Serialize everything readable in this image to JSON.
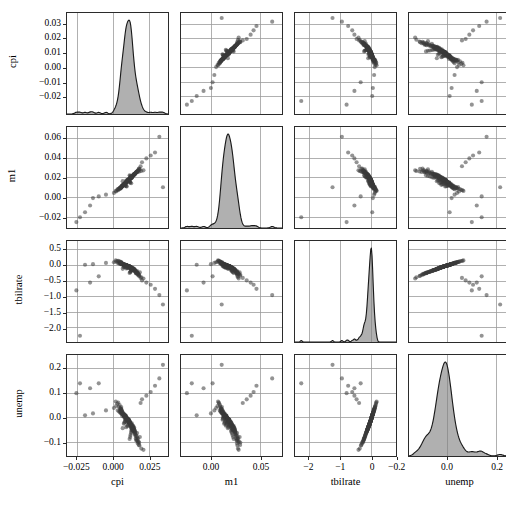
{
  "chart_data": {
    "type": "scatter",
    "plot_kind": "scatter-plot-matrix",
    "title": "",
    "variables": [
      "cpi",
      "m1",
      "tbilrate",
      "unemp"
    ],
    "grid": true,
    "legend": null,
    "diagonal": "kde",
    "axes": {
      "cpi": {
        "label": "cpi",
        "lim": [
          -0.032,
          0.038
        ],
        "xticks": [
          -0.025,
          0.0,
          0.025
        ],
        "xticklabels": [
          "−0.025",
          "0.000",
          "0.025"
        ],
        "yticks": [
          -0.02,
          -0.01,
          0.0,
          0.01,
          0.02,
          0.03
        ],
        "yticklabels": [
          "−0.02",
          "−0.01",
          "0.00",
          "0.01",
          "0.02",
          "0.03"
        ]
      },
      "m1": {
        "label": "m1",
        "lim": [
          -0.031,
          0.072
        ],
        "xticks": [
          0.0,
          0.05
        ],
        "xticklabels": [
          "0.00",
          "0.05"
        ],
        "yticks": [
          -0.02,
          0.0,
          0.02,
          0.04,
          0.06
        ],
        "yticklabels": [
          "−0.02",
          "0.00",
          "0.02",
          "0.04",
          "0.06"
        ]
      },
      "tbilrate": {
        "label": "tbilrate",
        "lim": [
          -2.45,
          0.78
        ],
        "xticks": [
          -2,
          -1,
          0
        ],
        "xticklabels": [
          "−2",
          "−1",
          "0"
        ],
        "yticks": [
          -2.0,
          -1.5,
          -1.0,
          -0.5,
          0.0,
          0.5
        ],
        "yticklabels": [
          "−2.0",
          "−1.5",
          "−1.0",
          "−0.5",
          "0.0",
          "0.5"
        ]
      },
      "unemp": {
        "label": "unemp",
        "lim": [
          -0.155,
          0.255
        ],
        "xticks": [
          -0.2,
          0.0,
          0.2
        ],
        "xticklabels": [
          "−0.2",
          "0.0",
          "0.2"
        ],
        "yticks": [
          -0.1,
          0.0,
          0.1,
          0.2
        ],
        "yticklabels": [
          "−0.1",
          "0.0",
          "0.1",
          "0.2"
        ]
      }
    },
    "marker": {
      "shape": "circle",
      "color": "#3a3a3a",
      "alpha": 0.55,
      "size": 2.1
    },
    "kde": {
      "fill_color": "#808080",
      "line_color": "#1a1a1a",
      "peaks": {
        "cpi": 0.0105,
        "m1": 0.0175,
        "tbilrate": -0.03,
        "unemp": -0.012
      },
      "notes": {
        "cpi": "sharp unimodal peak near 0.010 with small left shoulder near −0.015",
        "m1": "broad unimodal peak near 0.018",
        "tbilrate": "very sharp spike near 0.0 with long left tail to −2.3",
        "unemp": "sharp peak near −0.01 with right shoulder near 0.13"
      }
    },
    "series": {
      "cpi": [
        0.0105,
        0.0081,
        0.0129,
        0.0062,
        0.0142,
        0.0093,
        0.0047,
        0.0166,
        0.011,
        0.0074,
        0.0121,
        0.0058,
        0.0185,
        0.0099,
        0.0135,
        0.0032,
        0.0088,
        0.0154,
        0.0117,
        0.0069,
        0.0103,
        0.0146,
        0.0041,
        0.0091,
        0.0128,
        0.0077,
        0.0159,
        0.0112,
        0.0054,
        0.0133,
        0.0097,
        0.0171,
        0.0085,
        0.0118,
        0.0063,
        0.0141,
        0.0106,
        0.0049,
        0.0124,
        0.0089,
        0.0152,
        0.0115,
        0.0071,
        0.0137,
        0.0095,
        0.018,
        0.0108,
        0.0059,
        0.0126,
        0.0083,
        0.0148,
        0.0101,
        0.0066,
        0.0131,
        0.0092,
        0.0163,
        0.0113,
        0.0052,
        0.0122,
        0.0086,
        0.0144,
        0.0104,
        0.0073,
        0.0136,
        0.0096,
        0.0175,
        0.0109,
        0.0057,
        0.0125,
        0.0084,
        0.015,
        0.0102,
        0.0068,
        0.0132,
        0.0094,
        0.0168,
        0.0114,
        0.0051,
        0.012,
        0.0087,
        0.0143,
        0.01,
        0.0072,
        0.0138,
        0.0098,
        0.0178,
        0.0107,
        0.006,
        0.0127,
        0.0082,
        0.0147,
        0.0103,
        0.0067,
        0.013,
        0.009,
        0.0161,
        0.0111,
        0.0053,
        0.0123,
        0.0085,
        0.0145,
        0.0105,
        0.0075,
        0.0134,
        0.0093,
        0.0172,
        0.0116,
        0.0056,
        0.0119,
        0.0088,
        0.014,
        0.0099,
        0.007,
        0.0139,
        0.0091,
        0.0165,
        0.0106,
        0.0055,
        0.0129,
        0.008,
        0.0149,
        0.0104,
        0.0064,
        0.0135,
        0.0097,
        0.019,
        0.0122,
        0.0045,
        0.0116,
        0.0079,
        0.0151,
        0.0107,
        0.0061,
        0.0133,
        0.0095,
        0.02,
        0.0118,
        0.0035,
        0.0113,
        0.0076,
        0.0155,
        0.0109,
        0.0065,
        0.0131,
        0.0092,
        0.023,
        0.0127,
        0.002,
        0.011,
        0.0078,
        0.0157,
        0.011,
        0.0062,
        0.0128,
        0.0089,
        0.026,
        0.0121,
        0.0005,
        0.0108,
        0.0081,
        0.016,
        0.0112,
        0.0058,
        0.0126,
        0.0087,
        0.029,
        0.0124,
        -0.005,
        0.0102,
        0.0083,
        0.017,
        0.0115,
        0.0048,
        0.0124,
        0.0084,
        0.032,
        -0.01,
        -0.014,
        0.0098,
        0.0086,
        0.0182,
        0.0117,
        0.0038,
        0.012,
        0.008,
        0.0345,
        -0.016,
        -0.0195,
        0.009,
        0.009,
        0.0195,
        0.0119,
        0.0028,
        0.0118,
        0.0077,
        -0.023,
        -0.0255,
        0.0066,
        0.0094,
        0.021,
        0.0125,
        0.0018,
        0.0114,
        0.0074
      ],
      "m1": [
        0.0175,
        0.0142,
        0.0208,
        0.0121,
        0.0235,
        0.0163,
        0.0099,
        0.0262,
        0.0184,
        0.0136,
        0.0199,
        0.0113,
        0.0288,
        0.0171,
        0.0221,
        0.0086,
        0.0152,
        0.0248,
        0.0192,
        0.0129,
        0.0178,
        0.0231,
        0.0092,
        0.0158,
        0.0212,
        0.0144,
        0.0255,
        0.0187,
        0.0106,
        0.0217,
        0.0166,
        0.0272,
        0.0149,
        0.0195,
        0.0118,
        0.0228,
        0.0181,
        0.0101,
        0.0205,
        0.0154,
        0.0242,
        0.0189,
        0.0131,
        0.0224,
        0.0161,
        0.0295,
        0.0183,
        0.0111,
        0.0209,
        0.0147,
        0.0238,
        0.0177,
        0.0124,
        0.0216,
        0.0159,
        0.0265,
        0.0188,
        0.0096,
        0.0203,
        0.0151,
        0.0233,
        0.0179,
        0.0133,
        0.0222,
        0.0164,
        0.028,
        0.0185,
        0.0109,
        0.0211,
        0.0146,
        0.0241,
        0.0176,
        0.0127,
        0.0218,
        0.016,
        0.0268,
        0.019,
        0.0094,
        0.0201,
        0.0153,
        0.0236,
        0.0174,
        0.013,
        0.0225,
        0.0167,
        0.0293,
        0.0182,
        0.0116,
        0.0213,
        0.0143,
        0.0239,
        0.0173,
        0.0126,
        0.0219,
        0.0156,
        0.026,
        0.0186,
        0.0104,
        0.0207,
        0.015,
        0.0237,
        0.0172,
        0.0137,
        0.0223,
        0.0162,
        0.0276,
        0.0191,
        0.0107,
        0.02,
        0.0155,
        0.0234,
        0.017,
        0.0128,
        0.0226,
        0.0157,
        0.0263,
        0.018,
        0.0102,
        0.0206,
        0.0141,
        0.0243,
        0.0169,
        0.0122,
        0.022,
        0.0165,
        0.032,
        0.0196,
        0.0088,
        0.0198,
        0.0139,
        0.0245,
        0.0168,
        0.0119,
        0.0214,
        0.0163,
        0.036,
        0.0193,
        0.0075,
        0.0194,
        0.0135,
        0.025,
        0.0175,
        0.0115,
        0.021,
        0.0158,
        0.04,
        0.0197,
        0.0062,
        0.019,
        0.0132,
        0.0253,
        0.0171,
        0.0112,
        0.0204,
        0.0148,
        0.043,
        0.0202,
        0.0048,
        0.0186,
        0.0128,
        0.0257,
        0.0166,
        0.0108,
        0.0202,
        0.0145,
        0.046,
        0.0206,
        0.003,
        0.0182,
        0.0125,
        0.0261,
        0.0161,
        0.01,
        0.0208,
        0.0142,
        0.062,
        0.0012,
        -0.0005,
        0.0178,
        0.012,
        0.0266,
        0.0156,
        0.009,
        0.0215,
        0.0138,
        0.0105,
        -0.008,
        -0.015,
        0.0174,
        0.0117,
        0.0271,
        0.0152,
        0.0078,
        0.0221,
        0.0134,
        -0.02,
        -0.025,
        0.0168,
        0.0114,
        0.0278,
        0.0147,
        0.0068,
        0.0227,
        0.013
      ],
      "tbilrate": [
        -0.03,
        -0.01,
        -0.07,
        0.02,
        -0.12,
        -0.05,
        0.05,
        -0.18,
        -0.02,
        0.01,
        -0.09,
        0.04,
        -0.22,
        -0.04,
        -0.14,
        0.08,
        -0.01,
        -0.16,
        -0.06,
        0.03,
        -0.02,
        -0.11,
        0.06,
        0.0,
        -0.08,
        0.02,
        -0.2,
        -0.03,
        0.05,
        -0.13,
        -0.01,
        -0.25,
        0.01,
        -0.07,
        0.04,
        -0.15,
        -0.02,
        0.07,
        -0.09,
        0.0,
        -0.17,
        -0.04,
        0.03,
        -0.1,
        -0.01,
        -0.3,
        -0.03,
        0.06,
        -0.08,
        0.02,
        -0.14,
        -0.02,
        0.04,
        -0.11,
        0.0,
        -0.21,
        -0.05,
        0.09,
        -0.07,
        0.01,
        -0.13,
        -0.02,
        0.03,
        -0.1,
        -0.01,
        -0.28,
        -0.04,
        0.05,
        -0.09,
        0.02,
        -0.15,
        -0.01,
        0.04,
        -0.12,
        0.0,
        -0.23,
        -0.06,
        0.1,
        -0.06,
        0.01,
        -0.14,
        -0.02,
        0.03,
        -0.11,
        -0.01,
        -0.33,
        -0.05,
        0.07,
        -0.08,
        0.02,
        -0.16,
        -0.01,
        0.05,
        -0.1,
        0.0,
        -0.24,
        -0.04,
        0.08,
        -0.07,
        0.01,
        -0.13,
        -0.02,
        0.04,
        -0.12,
        -0.01,
        -0.27,
        -0.06,
        0.11,
        -0.05,
        0.02,
        -0.15,
        -0.03,
        0.03,
        -0.09,
        0.0,
        -0.26,
        -0.04,
        0.09,
        -0.06,
        0.01,
        -0.18,
        -0.02,
        0.06,
        -0.11,
        -0.01,
        -0.4,
        -0.07,
        0.13,
        -0.05,
        0.02,
        -0.19,
        -0.03,
        0.05,
        -0.1,
        0.0,
        -0.48,
        -0.08,
        0.15,
        -0.04,
        0.01,
        -0.21,
        -0.02,
        0.04,
        -0.13,
        -0.01,
        -0.55,
        -0.09,
        0.12,
        -0.06,
        0.03,
        -0.24,
        -0.03,
        0.06,
        -0.14,
        0.0,
        -0.62,
        -0.1,
        0.1,
        -0.07,
        0.02,
        -0.26,
        -0.04,
        0.07,
        -0.16,
        -0.02,
        -0.75,
        -0.12,
        0.08,
        -0.08,
        0.01,
        -0.3,
        -0.05,
        0.09,
        -0.18,
        -0.03,
        -0.95,
        -0.35,
        0.04,
        -0.09,
        0.0,
        -0.34,
        -0.06,
        0.11,
        -0.2,
        -0.04,
        -1.25,
        -0.55,
        0.02,
        -0.1,
        -0.01,
        -0.38,
        -0.07,
        0.14,
        -0.22,
        -0.05,
        -2.25,
        -0.8,
        -0.11,
        -0.02,
        -0.42,
        -0.08,
        0.16,
        -0.24,
        -0.06
      ],
      "unemp": [
        -0.012,
        -0.004,
        -0.028,
        0.008,
        -0.042,
        -0.018,
        0.022,
        -0.062,
        -0.008,
        0.004,
        -0.034,
        0.016,
        -0.078,
        -0.014,
        -0.05,
        0.03,
        -0.004,
        -0.058,
        -0.022,
        0.012,
        -0.008,
        -0.04,
        0.026,
        0.0,
        -0.03,
        0.008,
        -0.07,
        -0.012,
        0.02,
        -0.046,
        -0.004,
        -0.085,
        0.004,
        -0.026,
        0.018,
        -0.054,
        -0.008,
        0.028,
        -0.032,
        0.0,
        -0.06,
        -0.016,
        0.014,
        -0.036,
        -0.004,
        -0.1,
        -0.012,
        0.024,
        -0.03,
        0.01,
        -0.05,
        -0.008,
        0.016,
        -0.04,
        0.0,
        -0.075,
        -0.018,
        0.036,
        -0.026,
        0.006,
        -0.046,
        -0.008,
        0.012,
        -0.036,
        -0.004,
        -0.095,
        -0.016,
        0.02,
        -0.032,
        0.01,
        -0.054,
        -0.004,
        0.016,
        -0.042,
        0.0,
        -0.082,
        -0.022,
        0.04,
        -0.022,
        0.006,
        -0.05,
        -0.008,
        0.012,
        -0.04,
        -0.004,
        -0.11,
        -0.02,
        0.028,
        -0.03,
        0.008,
        -0.058,
        -0.004,
        0.02,
        -0.036,
        0.0,
        -0.086,
        -0.016,
        0.032,
        -0.026,
        0.006,
        -0.046,
        -0.008,
        0.016,
        -0.042,
        -0.004,
        -0.098,
        -0.022,
        0.044,
        -0.018,
        0.008,
        -0.054,
        -0.012,
        0.012,
        -0.032,
        0.0,
        -0.092,
        -0.016,
        0.036,
        -0.022,
        0.006,
        -0.064,
        -0.008,
        0.024,
        -0.04,
        -0.004,
        0.06,
        -0.026,
        0.052,
        -0.018,
        0.008,
        -0.068,
        -0.012,
        0.02,
        -0.036,
        0.0,
        0.075,
        -0.03,
        0.062,
        -0.016,
        0.006,
        -0.074,
        -0.008,
        0.016,
        -0.046,
        -0.004,
        0.09,
        -0.032,
        0.048,
        -0.022,
        0.012,
        -0.084,
        -0.012,
        0.024,
        -0.05,
        0.0,
        0.105,
        -0.036,
        0.04,
        -0.026,
        0.008,
        -0.092,
        -0.016,
        0.034,
        -0.056,
        -0.008,
        0.13,
        -0.042,
        0.03,
        -0.03,
        0.004,
        -0.104,
        -0.02,
        0.038,
        -0.062,
        -0.012,
        0.16,
        0.14,
        0.018,
        -0.034,
        0.0,
        -0.112,
        -0.024,
        0.046,
        -0.07,
        -0.016,
        0.215,
        0.12,
        0.01,
        -0.038,
        -0.004,
        -0.125,
        -0.028,
        0.058,
        -0.078,
        -0.02,
        0.14,
        0.1,
        -0.042,
        -0.008,
        -0.13,
        -0.032,
        0.066,
        -0.086,
        -0.024
      ]
    }
  },
  "layout": {
    "n": 4,
    "panel_size": 103,
    "gap": 11,
    "left": 66,
    "top": 12
  }
}
